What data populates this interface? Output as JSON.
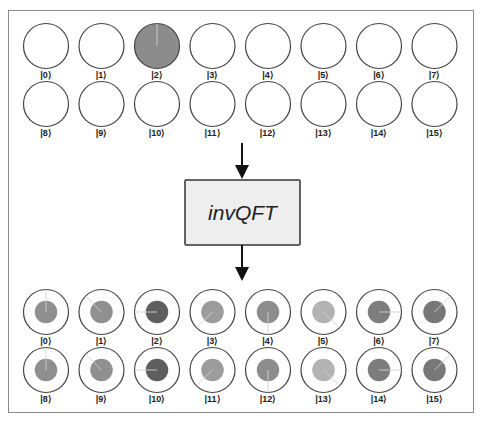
{
  "diagram": {
    "gate": {
      "label": "invQFT",
      "fill": "#eeeeee",
      "stroke": "#333333"
    },
    "input_register": {
      "name": "input",
      "states": [
        {
          "ket": "|0⟩",
          "label": "0",
          "magnitude": 0
        },
        {
          "ket": "|1⟩",
          "label": "1",
          "magnitude": 0
        },
        {
          "ket": "|2⟩",
          "label": "2",
          "magnitude": 1,
          "phase_deg": 0
        },
        {
          "ket": "|3⟩",
          "label": "3",
          "magnitude": 0
        },
        {
          "ket": "|4⟩",
          "label": "4",
          "magnitude": 0
        },
        {
          "ket": "|5⟩",
          "label": "5",
          "magnitude": 0
        },
        {
          "ket": "|6⟩",
          "label": "6",
          "magnitude": 0
        },
        {
          "ket": "|7⟩",
          "label": "7",
          "magnitude": 0
        },
        {
          "ket": "|8⟩",
          "label": "8",
          "magnitude": 0
        },
        {
          "ket": "|9⟩",
          "label": "9",
          "magnitude": 0
        },
        {
          "ket": "|10⟩",
          "label": "10",
          "magnitude": 0
        },
        {
          "ket": "|11⟩",
          "label": "11",
          "magnitude": 0
        },
        {
          "ket": "|12⟩",
          "label": "12",
          "magnitude": 0
        },
        {
          "ket": "|13⟩",
          "label": "13",
          "magnitude": 0
        },
        {
          "ket": "|14⟩",
          "label": "14",
          "magnitude": 0
        },
        {
          "ket": "|15⟩",
          "label": "15",
          "magnitude": 0
        }
      ]
    },
    "output_register": {
      "name": "output",
      "states": [
        {
          "ket": "|0⟩",
          "label": "0",
          "magnitude": 0.25,
          "phase_deg": 0,
          "fill": "#8f8f8f"
        },
        {
          "ket": "|1⟩",
          "label": "1",
          "magnitude": 0.25,
          "phase_deg": -45,
          "fill": "#909090"
        },
        {
          "ket": "|2⟩",
          "label": "2",
          "magnitude": 0.25,
          "phase_deg": -90,
          "fill": "#5e5e5e"
        },
        {
          "ket": "|3⟩",
          "label": "3",
          "magnitude": 0.25,
          "phase_deg": -135,
          "fill": "#9c9c9c"
        },
        {
          "ket": "|4⟩",
          "label": "4",
          "magnitude": 0.25,
          "phase_deg": 180,
          "fill": "#8d8d8d"
        },
        {
          "ket": "|5⟩",
          "label": "5",
          "magnitude": 0.25,
          "phase_deg": 135,
          "fill": "#b3b3b3"
        },
        {
          "ket": "|6⟩",
          "label": "6",
          "magnitude": 0.25,
          "phase_deg": 90,
          "fill": "#7d7d7d"
        },
        {
          "ket": "|7⟩",
          "label": "7",
          "magnitude": 0.25,
          "phase_deg": 45,
          "fill": "#777777"
        },
        {
          "ket": "|8⟩",
          "label": "8",
          "magnitude": 0.25,
          "phase_deg": 0,
          "fill": "#8f8f8f"
        },
        {
          "ket": "|9⟩",
          "label": "9",
          "magnitude": 0.25,
          "phase_deg": -45,
          "fill": "#909090"
        },
        {
          "ket": "|10⟩",
          "label": "10",
          "magnitude": 0.25,
          "phase_deg": -90,
          "fill": "#5e5e5e"
        },
        {
          "ket": "|11⟩",
          "label": "11",
          "magnitude": 0.25,
          "phase_deg": -135,
          "fill": "#9c9c9c"
        },
        {
          "ket": "|12⟩",
          "label": "12",
          "magnitude": 0.25,
          "phase_deg": 180,
          "fill": "#8d8d8d"
        },
        {
          "ket": "|13⟩",
          "label": "13",
          "magnitude": 0.25,
          "phase_deg": 135,
          "fill": "#b3b3b3"
        },
        {
          "ket": "|14⟩",
          "label": "14",
          "magnitude": 0.25,
          "phase_deg": 90,
          "fill": "#7d7d7d"
        },
        {
          "ket": "|15⟩",
          "label": "15",
          "magnitude": 0.25,
          "phase_deg": 45,
          "fill": "#777777"
        }
      ]
    },
    "colors": {
      "circle_stroke": "#444444",
      "full_fill": "#8c8c8c",
      "phase_line": "#d0d0d0",
      "arrow": "#111111",
      "frame": "#8a8a8a"
    }
  }
}
